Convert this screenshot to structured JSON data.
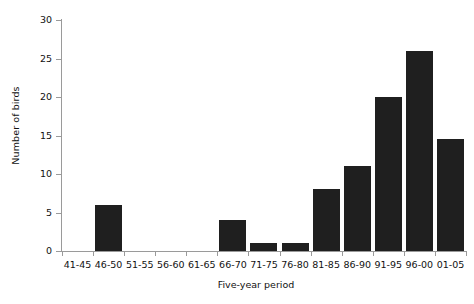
{
  "chart_data": {
    "type": "bar",
    "title": "",
    "subtitle": "",
    "xlabel": "Five-year period",
    "ylabel": "Number of birds",
    "categories": [
      "41-45",
      "46-50",
      "51-55",
      "56-60",
      "61-65",
      "66-70",
      "71-75",
      "76-80",
      "81-85",
      "86-90",
      "91-95",
      "96-00",
      "01-05"
    ],
    "values": [
      0,
      6,
      0,
      0,
      0,
      4,
      1,
      1,
      8,
      11,
      20,
      26,
      14.5
    ],
    "ylim": [
      0,
      30
    ],
    "yticks": [
      0,
      5,
      10,
      15,
      20,
      25,
      30
    ],
    "ytick_labels": [
      "0",
      "5",
      "10",
      "15",
      "20",
      "25",
      "30"
    ],
    "grid": false,
    "legend": false,
    "legend_position": "none",
    "bar_color": "#1f1f1f",
    "axis_color": "#9a9a9a",
    "background_color": "#ffffff"
  }
}
